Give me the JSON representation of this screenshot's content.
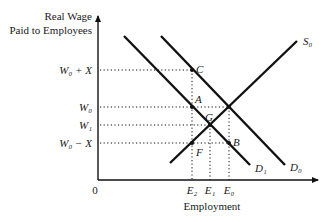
{
  "diagram": {
    "y_axis_label_line1": "Real Wage",
    "y_axis_label_line2": "Paid to Employees",
    "x_axis_label": "Employment",
    "origin": "0",
    "y_ticks": {
      "w0_plus_x": "W₀ + X",
      "w0": "W₀",
      "w1": "W₁",
      "w0_minus_x": "W₀ − X"
    },
    "x_ticks": {
      "e2": "E₂",
      "e1": "E₁",
      "e0": "E₀"
    },
    "curves": {
      "supply": "S₀",
      "demand_original": "D₀",
      "demand_shifted": "D₁"
    },
    "points": {
      "a": "A",
      "b": "B",
      "c": "C",
      "f": "F",
      "g": "G"
    },
    "colors": {
      "line": "#111111",
      "background": "#ffffff"
    }
  }
}
